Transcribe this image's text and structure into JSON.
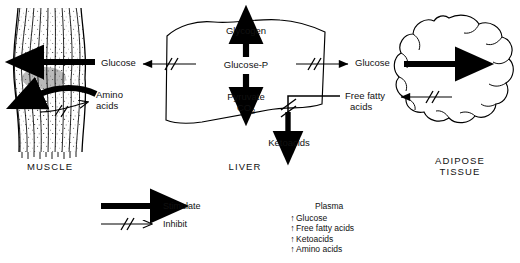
{
  "diagram": {
    "title_present": false,
    "organs": [
      {
        "id": "muscle",
        "label": "MUSCLE"
      },
      {
        "id": "liver",
        "label": "LIVER"
      },
      {
        "id": "adipose",
        "label": "ADIPOSE\nTISSUE",
        "line1": "ADIPOSE",
        "line2": "TISSUE"
      }
    ],
    "liver_pathway": {
      "glycogen": "Glycogen",
      "glucose_p": "Glucose-P",
      "pyruvate": "Pyruvate",
      "co2": "CO",
      "co2_sub": "2",
      "ketoacids": "Ketoacids"
    },
    "flux_labels": {
      "muscle_glucose": "Glucose",
      "muscle_amino_line1": "Amino",
      "muscle_amino_line2": "acids",
      "adipose_glucose": "Glucose",
      "adipose_ffa_line1": "Free fatty",
      "adipose_ffa_line2": "acids"
    },
    "legend": {
      "stimulate": "Stimulate",
      "inhibit": "Inhibit"
    },
    "plasma": {
      "header": "Plasma",
      "items": [
        {
          "marker": "↑",
          "label": "Glucose"
        },
        {
          "marker": "↑",
          "label": "Free fatty acids"
        },
        {
          "marker": "↑",
          "label": "Ketoacids"
        },
        {
          "marker": "↑",
          "label": "Amino acids"
        }
      ]
    },
    "colors": {
      "ink": "#000000",
      "background": "#ffffff",
      "stipple": "#3a3a3a"
    }
  }
}
